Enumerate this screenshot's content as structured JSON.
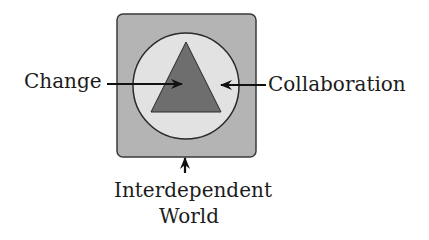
{
  "diagram": {
    "labels": {
      "left": "Change",
      "right": "Collaboration",
      "bottom_line1": "Interdependent",
      "bottom_line2": "World"
    },
    "shapes": {
      "outer_box": {
        "label": "Interdependent World",
        "fill": "#b4b4b4",
        "stroke": "#3a3a3a"
      },
      "circle": {
        "label": "Collaboration",
        "fill": "#e2e2e2",
        "stroke": "#2a2a2a"
      },
      "triangle": {
        "label": "Change",
        "fill": "#6e6e6e",
        "stroke": "#2a2a2a"
      }
    },
    "arrows": [
      {
        "from": "Change",
        "points_to": "triangle",
        "direction": "right"
      },
      {
        "from": "Collaboration",
        "points_to": "circle",
        "direction": "left"
      },
      {
        "from": "Interdependent World",
        "points_to": "outer_box",
        "direction": "up"
      }
    ]
  }
}
